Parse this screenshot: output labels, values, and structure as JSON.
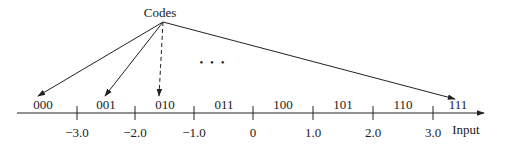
{
  "title": "Codes",
  "axis": {
    "label": "Input",
    "ticks": [
      {
        "x": 77,
        "label": "−3.0"
      },
      {
        "x": 135,
        "label": "−2.0"
      },
      {
        "x": 194,
        "label": "−1.0"
      },
      {
        "x": 253,
        "label": "0"
      },
      {
        "x": 313,
        "label": "1.0"
      },
      {
        "x": 373,
        "label": "2.0"
      },
      {
        "x": 433,
        "label": "3.0"
      }
    ]
  },
  "codes": [
    {
      "x": 43,
      "label": "000"
    },
    {
      "x": 106,
      "label": "001"
    },
    {
      "x": 165,
      "label": "010"
    },
    {
      "x": 224,
      "label": "011"
    },
    {
      "x": 283,
      "label": "100"
    },
    {
      "x": 343,
      "label": "101"
    },
    {
      "x": 403,
      "label": "110"
    },
    {
      "x": 458,
      "label": "111"
    }
  ],
  "arrows": [
    {
      "target": "000",
      "style": "solid",
      "x2": 38,
      "y2": 96
    },
    {
      "target": "001",
      "style": "solid",
      "x2": 105,
      "y2": 96
    },
    {
      "target": "010",
      "style": "dashed",
      "x2": 159,
      "y2": 96
    },
    {
      "target": "111",
      "style": "solid",
      "x2": 455,
      "y2": 99
    }
  ],
  "ellipsis": "• • •",
  "colors": {
    "ink": "#222222",
    "background": "#ffffff"
  }
}
